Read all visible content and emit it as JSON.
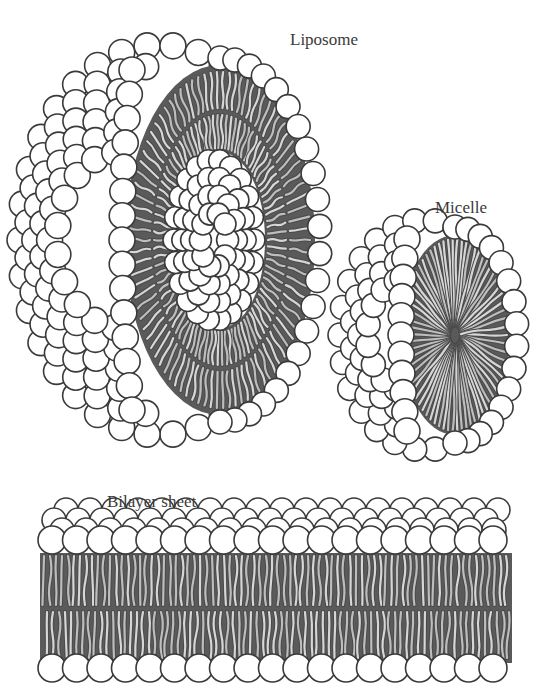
{
  "labels": {
    "liposome": "Liposome",
    "micelle": "Micelle",
    "bilayer": "Bilayer sheet"
  },
  "structures": [
    {
      "name": "Liposome",
      "description": "spherical vesicle cut open showing lipid bilayer shell with inner aqueous core",
      "center": [
        170,
        240
      ]
    },
    {
      "name": "Micelle",
      "description": "sphere of lipid heads cut open showing tails pointing to center",
      "center": [
        435,
        335
      ]
    },
    {
      "name": "Bilayer sheet",
      "description": "flat double layer of phospholipids, heads outward, tails inward",
      "x_range": [
        40,
        512
      ]
    }
  ],
  "colors": {
    "head_fill": "#ffffff",
    "head_stroke": "#3a3a3a",
    "tail_light": "#bdbdbd",
    "tail_dark": "#4a4a4a",
    "core_dark": "#5a5a5a",
    "text": "#3a3a3a"
  }
}
